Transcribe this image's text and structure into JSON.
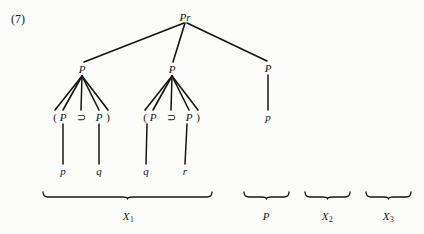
{
  "figure": {
    "number_label": "(7)",
    "background_color": "#fcfcfb",
    "ink_color": "#141414",
    "width": 424,
    "height": 234
  },
  "tree": {
    "root": {
      "label": "Pr",
      "x": 185,
      "y": 17
    },
    "nodes": [
      {
        "id": "root",
        "label": "Pr",
        "x": 185,
        "y": 17
      },
      {
        "id": "p-left",
        "label": "P",
        "x": 82,
        "y": 69
      },
      {
        "id": "p-mid",
        "label": "P",
        "x": 172,
        "y": 69
      },
      {
        "id": "p-right",
        "label": "P",
        "x": 268,
        "y": 68
      },
      {
        "id": "l1-open",
        "label": "(",
        "x": 55,
        "y": 117
      },
      {
        "id": "l1-p1",
        "label": "P",
        "x": 63,
        "y": 117
      },
      {
        "id": "l1-horseshoe",
        "label": "⊃",
        "x": 81,
        "y": 117
      },
      {
        "id": "l1-p2",
        "label": "P",
        "x": 99,
        "y": 117
      },
      {
        "id": "l1-close",
        "label": ")",
        "x": 108,
        "y": 117
      },
      {
        "id": "l2-open",
        "label": "(",
        "x": 145,
        "y": 117
      },
      {
        "id": "l2-p1",
        "label": "P",
        "x": 153,
        "y": 117
      },
      {
        "id": "l2-horseshoe",
        "label": "⊃",
        "x": 171,
        "y": 117
      },
      {
        "id": "l2-p2",
        "label": "P",
        "x": 189,
        "y": 117
      },
      {
        "id": "l2-close",
        "label": ")",
        "x": 198,
        "y": 117
      },
      {
        "id": "leaf-p1",
        "label": "p",
        "x": 63,
        "y": 171
      },
      {
        "id": "leaf-q1",
        "label": "q",
        "x": 99,
        "y": 171
      },
      {
        "id": "leaf-q2",
        "label": "q",
        "x": 146,
        "y": 171
      },
      {
        "id": "leaf-r1",
        "label": "r",
        "x": 185,
        "y": 171
      },
      {
        "id": "leaf-p2",
        "label": "p",
        "x": 268,
        "y": 117
      }
    ],
    "edges": [
      {
        "from": "root",
        "to": "p-left",
        "x1": 184,
        "y1": 23,
        "x2": 84,
        "y2": 62
      },
      {
        "from": "root",
        "to": "p-mid",
        "x1": 185,
        "y1": 23,
        "x2": 173,
        "y2": 62
      },
      {
        "from": "root",
        "to": "p-right",
        "x1": 187,
        "y1": 23,
        "x2": 267,
        "y2": 61
      },
      {
        "from": "p-left",
        "to": "l1-open",
        "x1": 82,
        "y1": 76,
        "x2": 55,
        "y2": 110
      },
      {
        "from": "p-left",
        "to": "l1-p1",
        "x1": 82,
        "y1": 76,
        "x2": 63,
        "y2": 110
      },
      {
        "from": "p-left",
        "to": "l1-horseshoe",
        "x1": 82,
        "y1": 76,
        "x2": 81,
        "y2": 110
      },
      {
        "from": "p-left",
        "to": "l1-p2",
        "x1": 82,
        "y1": 76,
        "x2": 99,
        "y2": 110
      },
      {
        "from": "p-left",
        "to": "l1-close",
        "x1": 82,
        "y1": 76,
        "x2": 108,
        "y2": 110
      },
      {
        "from": "p-mid",
        "to": "l2-open",
        "x1": 172,
        "y1": 76,
        "x2": 145,
        "y2": 110
      },
      {
        "from": "p-mid",
        "to": "l2-p1",
        "x1": 172,
        "y1": 76,
        "x2": 153,
        "y2": 110
      },
      {
        "from": "p-mid",
        "to": "l2-horseshoe",
        "x1": 172,
        "y1": 76,
        "x2": 171,
        "y2": 110
      },
      {
        "from": "p-mid",
        "to": "l2-p2",
        "x1": 172,
        "y1": 76,
        "x2": 189,
        "y2": 110
      },
      {
        "from": "p-mid",
        "to": "l2-close",
        "x1": 172,
        "y1": 76,
        "x2": 198,
        "y2": 110
      },
      {
        "from": "l1-p1",
        "to": "leaf-p1",
        "x1": 63,
        "y1": 124,
        "x2": 63,
        "y2": 164
      },
      {
        "from": "l1-p2",
        "to": "leaf-q1",
        "x1": 99,
        "y1": 124,
        "x2": 99,
        "y2": 164
      },
      {
        "from": "l2-p1",
        "to": "leaf-q2",
        "x1": 147,
        "y1": 124,
        "x2": 146,
        "y2": 164
      },
      {
        "from": "l2-p2",
        "to": "leaf-r1",
        "x1": 187,
        "y1": 124,
        "x2": 185,
        "y2": 164
      },
      {
        "from": "p-right",
        "to": "leaf-p2",
        "x1": 268,
        "y1": 75,
        "x2": 268,
        "y2": 110
      }
    ]
  },
  "brackets": [
    {
      "id": "x1",
      "label": "X",
      "sub": "1",
      "left": 43,
      "right": 212,
      "y": 192,
      "label_x": 128,
      "label_y": 216
    },
    {
      "id": "p",
      "label": "P",
      "sub": "",
      "left": 244,
      "right": 289,
      "y": 192,
      "label_x": 266,
      "label_y": 216
    },
    {
      "id": "x2",
      "label": "X",
      "sub": "2",
      "left": 305,
      "right": 350,
      "y": 192,
      "label_x": 327,
      "label_y": 216
    },
    {
      "id": "x3",
      "label": "X",
      "sub": "3",
      "left": 366,
      "right": 411,
      "y": 192,
      "label_x": 388,
      "label_y": 216
    }
  ]
}
